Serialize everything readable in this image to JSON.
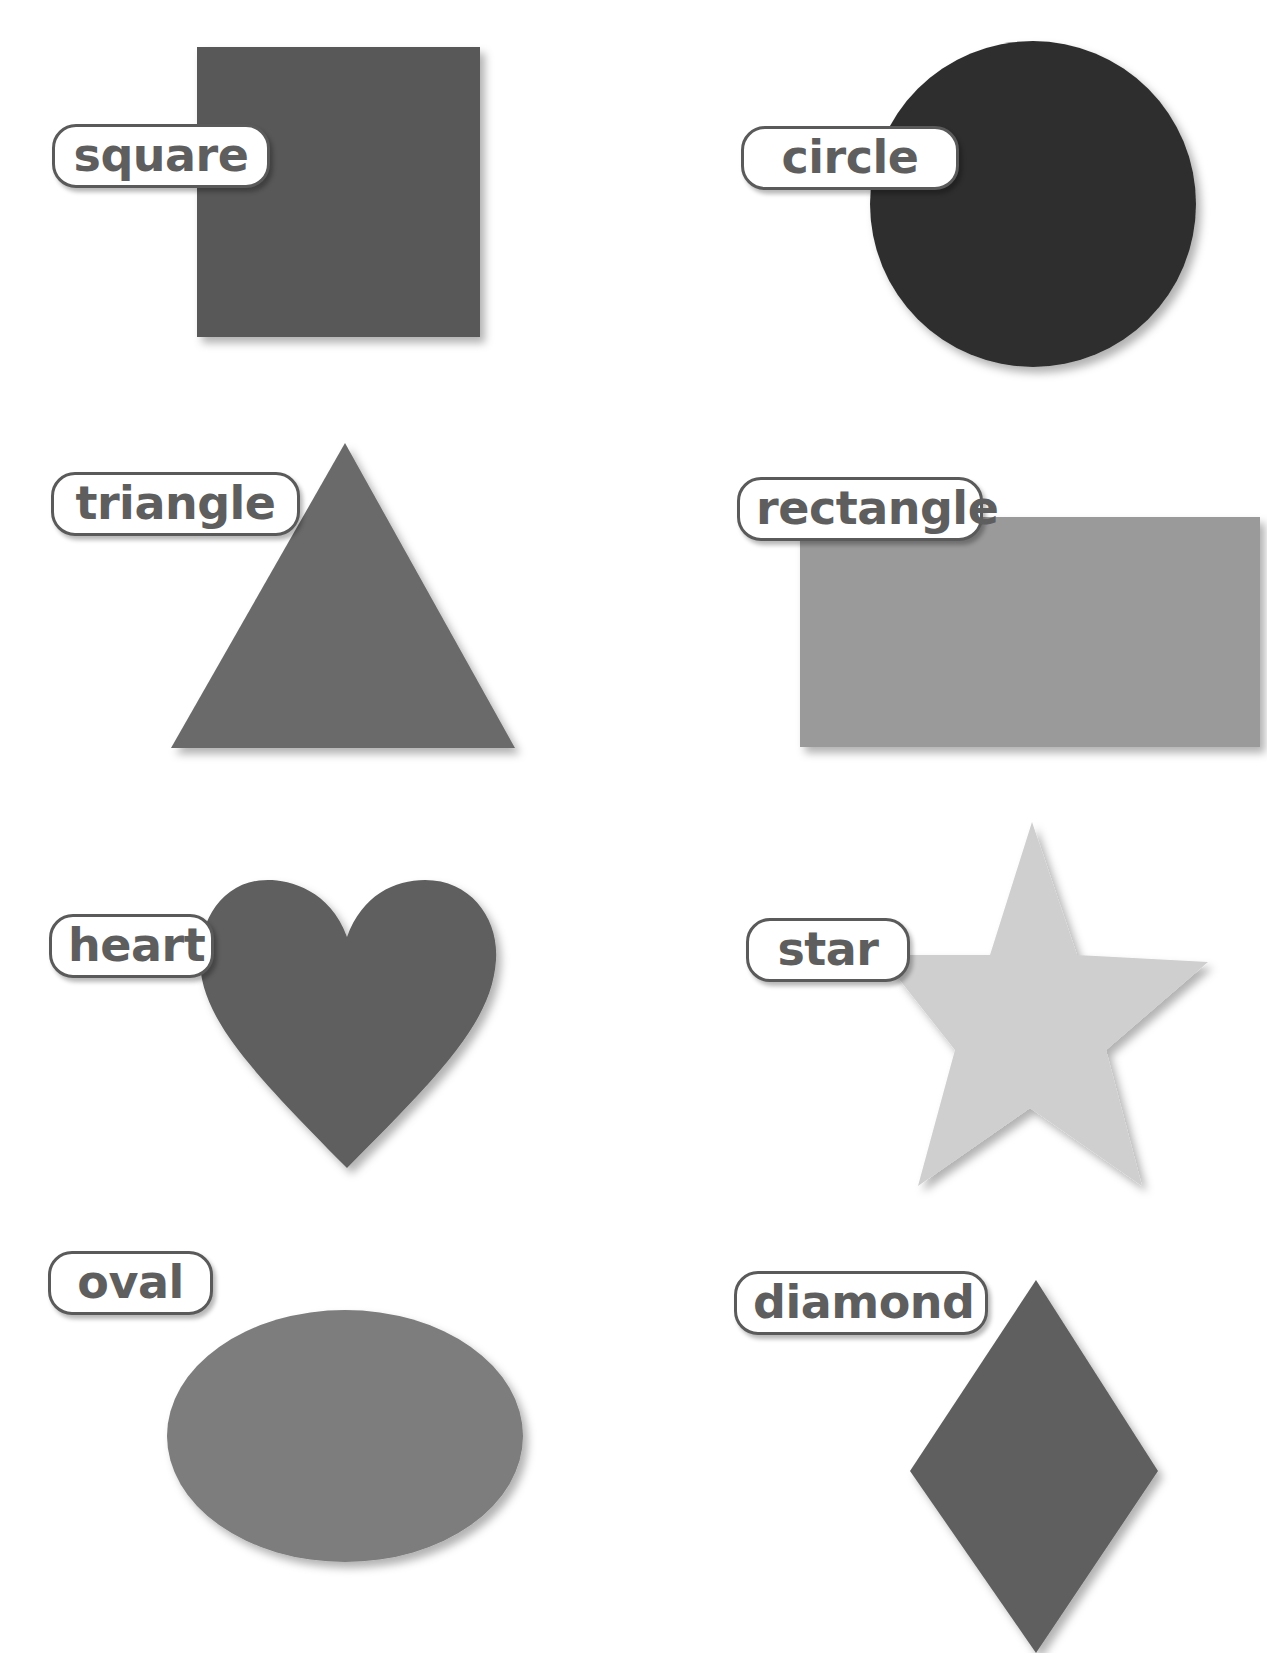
{
  "shapes": [
    {
      "name": "square",
      "label": "square",
      "fill": "#585858"
    },
    {
      "name": "circle",
      "label": "circle",
      "fill": "#2e2e2e"
    },
    {
      "name": "triangle",
      "label": "triangle",
      "fill": "#6a6a6a"
    },
    {
      "name": "rectangle",
      "label": "rectangle",
      "fill": "#9a9a9a"
    },
    {
      "name": "heart",
      "label": "heart",
      "fill": "#5f5f5f"
    },
    {
      "name": "star",
      "label": "star",
      "fill": "#cfcfcf"
    },
    {
      "name": "oval",
      "label": "oval",
      "fill": "#7d7d7d"
    },
    {
      "name": "diamond",
      "label": "diamond",
      "fill": "#5f5f5f"
    }
  ],
  "colors": {
    "label_border": "#5a5a5a",
    "label_text": "#5e5e5e",
    "background": "#ffffff"
  }
}
